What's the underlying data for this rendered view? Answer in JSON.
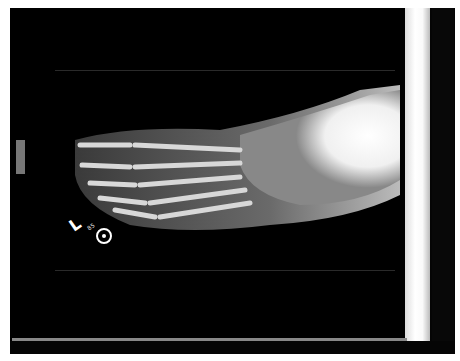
{
  "image": {
    "subject": "Radiograph of left foot, oblique view",
    "marker": {
      "side_label": "L",
      "small_text": "85",
      "has_circle_marker": true
    },
    "colors": {
      "background": "#000000",
      "bone": "#e8e8e8",
      "border_strip": "#ffffff"
    }
  }
}
